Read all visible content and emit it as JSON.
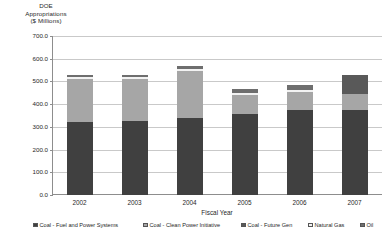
{
  "chart_data": {
    "type": "bar",
    "subtype": "stacked-bar",
    "title": "",
    "ylabel": "DOE Appropriations ($ Millions)",
    "ylabel_lines": [
      "DOE",
      "Appropriations",
      "($ Millions)"
    ],
    "xlabel": "Fiscal Year",
    "categories": [
      "2002",
      "2003",
      "2004",
      "2005",
      "2006",
      "2007"
    ],
    "ylim": [
      0,
      700
    ],
    "ytick_step": 100,
    "ytick_labels": [
      "0.0",
      "100.0",
      "200.0",
      "300.0",
      "400.0",
      "500.0",
      "600.0",
      "700.0"
    ],
    "ytick_values": [
      0,
      100,
      200,
      300,
      400,
      500,
      600,
      700
    ],
    "grid": true,
    "grid_axis": "y",
    "legend_position": "bottom",
    "series": [
      {
        "name": "Coal - Fuel and Power Systems",
        "color": "#404040",
        "values": [
          322.0,
          327.0,
          337.0,
          358.0,
          375.0,
          375.0
        ]
      },
      {
        "name": "Coal - Clean Power Initiative",
        "color": "#a6a6a6",
        "values": [
          190.0,
          186.0,
          211.0,
          82.0,
          80.0,
          68.0
        ]
      },
      {
        "name": "Coal - Future Gen",
        "color": "#595959",
        "values": [
          0.0,
          0.0,
          0.0,
          0.0,
          0.0,
          87.0
        ]
      },
      {
        "name": "Natural Gas",
        "color": "#f2f2f2",
        "values": [
          6.0,
          5.0,
          7.0,
          10.0,
          9.0,
          0.0
        ]
      },
      {
        "name": "Oil",
        "color": "#6e6e6e",
        "values": [
          10.0,
          9.0,
          15.0,
          15.0,
          19.0,
          0.0
        ]
      }
    ],
    "totals": [
      528.0,
      527.0,
      570.0,
      465.0,
      483.0,
      530.0
    ]
  },
  "legend": {
    "items": [
      {
        "label": "Coal - Fuel and Power Systems",
        "color": "#404040",
        "left": 33
      },
      {
        "label": "Coal - Clean Power Initiative",
        "color": "#a6a6a6",
        "left": 143
      },
      {
        "label": "Coal - Future Gen",
        "color": "#595959",
        "left": 241
      },
      {
        "label": "Natural Gas",
        "color": "#f2f2f2",
        "left": 308
      },
      {
        "label": "Oil",
        "color": "#6e6e6e",
        "left": 360
      }
    ]
  }
}
